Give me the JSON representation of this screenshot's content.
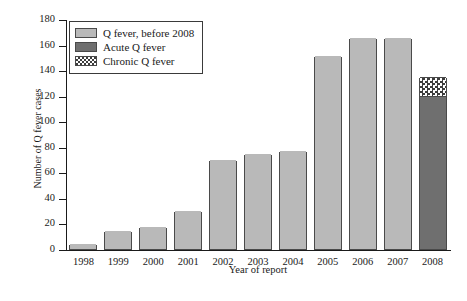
{
  "chart_data": {
    "type": "bar",
    "title": "",
    "xlabel": "Year of report",
    "ylabel": "Number of Q fever cases",
    "categories": [
      "1998",
      "1999",
      "2000",
      "2001",
      "2002",
      "2003",
      "2004",
      "2005",
      "2006",
      "2007",
      "2008"
    ],
    "ylim": [
      0,
      180
    ],
    "yticks": [
      0,
      20,
      40,
      60,
      80,
      100,
      120,
      140,
      160,
      180
    ],
    "grid": false,
    "legend_position": "top-left",
    "stacked": true,
    "series": [
      {
        "name": "Q fever, before 2008",
        "color": "#b9b9b9",
        "values": [
          4,
          14,
          17,
          30,
          70,
          74,
          77,
          151,
          165,
          165,
          0
        ]
      },
      {
        "name": "Acute Q fever",
        "color": "#6f6f6f",
        "values": [
          0,
          0,
          0,
          0,
          0,
          0,
          0,
          0,
          0,
          0,
          119
        ]
      },
      {
        "name": "Chronic Q fever",
        "color": "checkerboard",
        "values": [
          0,
          0,
          0,
          0,
          0,
          0,
          0,
          0,
          0,
          0,
          16
        ]
      }
    ],
    "totals": [
      4,
      14,
      17,
      30,
      70,
      74,
      77,
      151,
      165,
      165,
      135
    ]
  },
  "axes": {
    "y_title": "Number of Q fever cases",
    "x_title": "Year of report",
    "y_tick_labels": [
      "180",
      "160",
      "140",
      "120",
      "100",
      "80",
      "60",
      "40",
      "20",
      "0"
    ],
    "x_tick_labels": [
      "1998",
      "1999",
      "2000",
      "2001",
      "2002",
      "2003",
      "2004",
      "2005",
      "2006",
      "2007",
      "2008"
    ]
  },
  "legend": {
    "items": [
      {
        "label": "Q fever, before 2008",
        "swatch": "light-gray-solid"
      },
      {
        "label": "Acute Q fever",
        "swatch": "dark-gray-solid"
      },
      {
        "label": "Chronic Q fever",
        "swatch": "checkered"
      }
    ]
  }
}
